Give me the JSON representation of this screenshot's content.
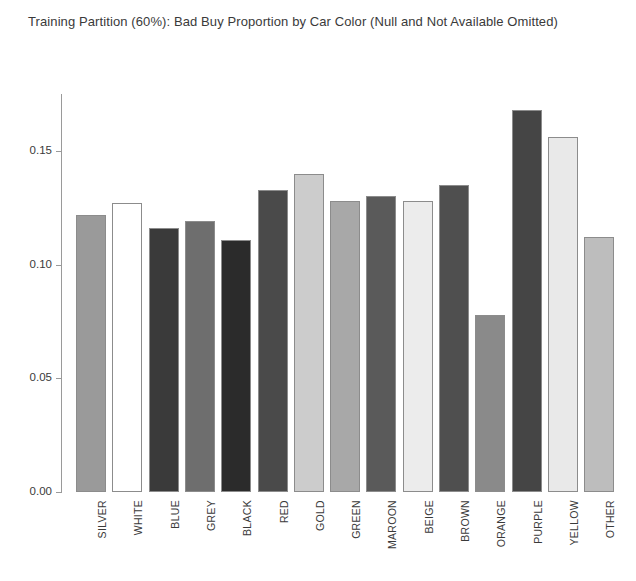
{
  "chart_data": {
    "type": "bar",
    "title": "Training Partition (60%): Bad Buy Proportion by Car Color (Null and Not Available Omitted)",
    "xlabel": "",
    "ylabel": "",
    "grid": false,
    "legend": null,
    "ylim": [
      0.0,
      0.175
    ],
    "ytick_labels": [
      "0.00",
      "0.05",
      "0.10",
      "0.15"
    ],
    "ytick_values": [
      0.0,
      0.05,
      0.1,
      0.15
    ],
    "categories": [
      "SILVER",
      "WHITE",
      "BLUE",
      "GREY",
      "BLACK",
      "RED",
      "GOLD",
      "GREEN",
      "MAROON",
      "BEIGE",
      "BROWN",
      "ORANGE",
      "PURPLE",
      "YELLOW",
      "OTHER"
    ],
    "values": [
      0.122,
      0.127,
      0.116,
      0.119,
      0.111,
      0.133,
      0.14,
      0.128,
      0.13,
      0.128,
      0.135,
      0.078,
      0.168,
      0.156,
      0.112
    ],
    "bar_colors": [
      "#9a9a9a",
      "#ffffff",
      "#3a3a3a",
      "#6e6e6e",
      "#2b2b2b",
      "#4a4a4a",
      "#cccccc",
      "#a8a8a8",
      "#5a5a5a",
      "#ececec",
      "#4f4f4f",
      "#8a8a8a",
      "#454545",
      "#e9e9e9",
      "#bdbdbd"
    ]
  },
  "axis": {
    "tick_color": "#9a9a9a",
    "label_color": "#3a3a3a"
  }
}
